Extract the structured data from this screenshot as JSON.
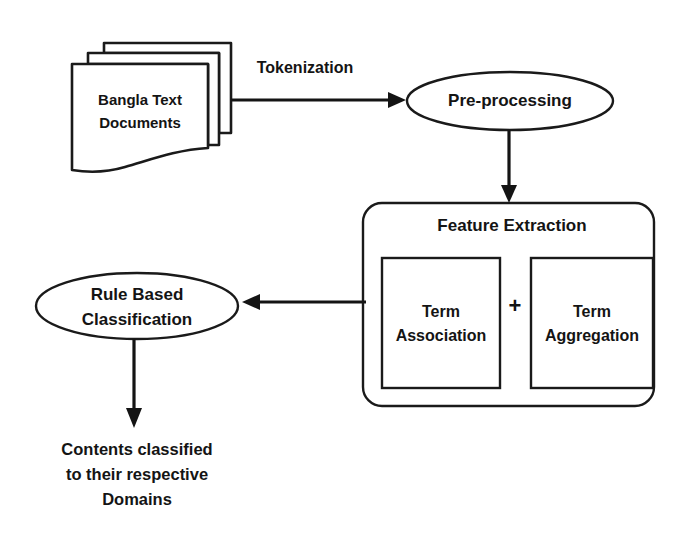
{
  "diagram": {
    "background_color": "#ffffff",
    "stroke_color": "#1a1a1a",
    "text_color": "#141414",
    "nodes": {
      "documents": {
        "shape": "document-stack",
        "label_line1": "Bangla Text",
        "label_line2": "Documents"
      },
      "preprocessing": {
        "shape": "ellipse",
        "label": "Pre-processing"
      },
      "feature_extraction": {
        "shape": "rounded-rectangle",
        "label": "Feature Extraction",
        "children": [
          {
            "shape": "rectangle",
            "label_line1": "Term",
            "label_line2": "Association"
          },
          {
            "shape": "rectangle",
            "label_line1": "Term",
            "label_line2": "Aggregation"
          }
        ],
        "operator": "+"
      },
      "classification": {
        "shape": "ellipse",
        "label_line1": "Rule Based",
        "label_line2": "Classification"
      },
      "output": {
        "shape": "text",
        "label_line1": "Contents classified",
        "label_line2": "to their respective",
        "label_line3": "Domains"
      }
    },
    "edges": [
      {
        "from": "documents",
        "to": "preprocessing",
        "label": "Tokenization",
        "direction": "right"
      },
      {
        "from": "preprocessing",
        "to": "feature_extraction",
        "label": "",
        "direction": "down"
      },
      {
        "from": "feature_extraction",
        "to": "classification",
        "label": "",
        "direction": "left"
      },
      {
        "from": "classification",
        "to": "output",
        "label": "",
        "direction": "down"
      }
    ]
  }
}
